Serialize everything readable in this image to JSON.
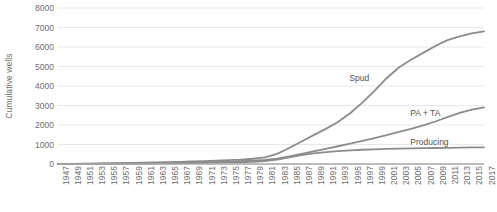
{
  "chart_data": {
    "type": "line",
    "title": "",
    "subtitle": "",
    "xlabel": "",
    "ylabel": "Cumulative wells",
    "ylim": [
      0,
      8000
    ],
    "ytick_step": 1000,
    "yticks": [
      0,
      1000,
      2000,
      3000,
      4000,
      5000,
      6000,
      7000,
      8000
    ],
    "grid": true,
    "grid_axis": "y",
    "legend_position": "inline-labels",
    "x": [
      1947,
      1949,
      1951,
      1953,
      1955,
      1957,
      1959,
      1961,
      1963,
      1965,
      1967,
      1969,
      1971,
      1973,
      1975,
      1977,
      1979,
      1981,
      1983,
      1985,
      1987,
      1989,
      1991,
      1993,
      1995,
      1997,
      1999,
      2001,
      2003,
      2005,
      2007,
      2009,
      2011,
      2013,
      2015,
      2017
    ],
    "xtick_labels": [
      "1947",
      "1949",
      "1951",
      "1953",
      "1955",
      "1957",
      "1959",
      "1961",
      "1963",
      "1965",
      "1967",
      "1969",
      "1971",
      "1973",
      "1975",
      "1977",
      "1979",
      "1981",
      "1983",
      "1985",
      "1987",
      "1989",
      "1991",
      "1993",
      "1995",
      "1997",
      "1999",
      "2001",
      "2003",
      "2005",
      "2007",
      "2009",
      "2011",
      "2013",
      "2015",
      "2017"
    ],
    "series": [
      {
        "name": "Spud",
        "color": "#8c8c8c",
        "label_x": 1999,
        "label_y": 4300,
        "values": [
          5,
          10,
          15,
          22,
          30,
          40,
          52,
          65,
          80,
          95,
          112,
          130,
          150,
          172,
          196,
          225,
          270,
          340,
          520,
          820,
          1150,
          1480,
          1800,
          2150,
          2600,
          3150,
          3750,
          4400,
          4950,
          5350,
          5700,
          6050,
          6350,
          6550,
          6700,
          6800
        ]
      },
      {
        "name": "PA + TA",
        "color": "#8c8c8c",
        "label_x": 2009,
        "label_y": 2500,
        "values": [
          3,
          6,
          9,
          13,
          18,
          24,
          31,
          39,
          48,
          58,
          69,
          81,
          94,
          108,
          124,
          142,
          168,
          205,
          280,
          390,
          520,
          650,
          780,
          910,
          1040,
          1180,
          1330,
          1480,
          1650,
          1800,
          1980,
          2180,
          2400,
          2620,
          2790,
          2900
        ]
      },
      {
        "name": "Producing",
        "color": "#8c8c8c",
        "label_x": 2009,
        "label_y": 1050,
        "values": [
          2,
          4,
          6,
          9,
          12,
          16,
          21,
          26,
          32,
          38,
          45,
          52,
          60,
          69,
          79,
          90,
          110,
          145,
          230,
          340,
          450,
          540,
          610,
          660,
          700,
          730,
          755,
          775,
          790,
          800,
          810,
          820,
          830,
          840,
          848,
          855
        ]
      }
    ]
  }
}
